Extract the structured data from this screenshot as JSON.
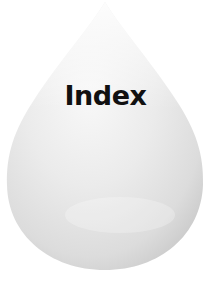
{
  "drop": {
    "label": "Index",
    "fill_light": "#f7f7f7",
    "fill_mid": "#e4e4e4",
    "fill_dark": "#cfcfcf",
    "text_color": "#111111"
  }
}
